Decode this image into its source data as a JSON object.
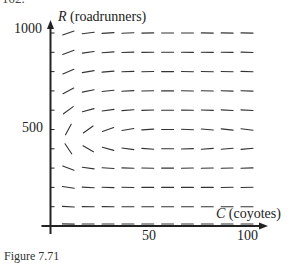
{
  "page": {
    "top_fragment": "102.",
    "caption": "Figure 7.71"
  },
  "axes": {
    "y_label_var": "R",
    "y_label_text": "(roadrunners)",
    "x_label_var": "C",
    "x_label_text": "(coyotes)",
    "y_ticks": [
      {
        "value": 1000,
        "label": "1000"
      },
      {
        "value": 500,
        "label": "500"
      }
    ],
    "x_ticks": [
      {
        "value": 50,
        "label": "50"
      },
      {
        "value": 100,
        "label": "100"
      }
    ],
    "x_range": [
      0,
      100
    ],
    "y_range": [
      0,
      1000
    ],
    "y_minor_tick_step": 100,
    "color": "#222222"
  },
  "chart_data": {
    "type": "slope_field",
    "title": "",
    "xlabel": "C (coyotes)",
    "ylabel": "R (roadrunners)",
    "xlim": [
      0,
      100
    ],
    "ylim": [
      0,
      1000
    ],
    "grid": false,
    "sample_C": [
      10,
      20,
      30,
      40,
      50,
      60,
      70,
      80,
      90,
      100
    ],
    "sample_R": [
      0,
      100,
      200,
      300,
      400,
      500,
      600,
      700,
      800,
      900,
      1000
    ],
    "equilibrium": {
      "C": 60,
      "R": 450
    },
    "model": "dR/dC = R(a - bC) / (C(-c + dR)), predator-prey closed orbits around equilibrium",
    "segment_color": "#333333"
  },
  "layout": {
    "origin_px": [
      50.5,
      226
    ],
    "x_px_per_unit": 1.985,
    "y_px_per_unit": 0.193,
    "segment_half_length": 6
  }
}
